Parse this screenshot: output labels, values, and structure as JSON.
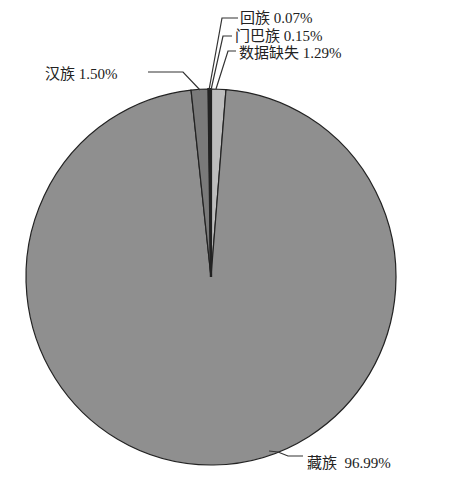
{
  "chart_data": {
    "type": "pie",
    "title": "",
    "categories": [
      "藏族",
      "汉族",
      "回族",
      "门巴族",
      "数据缺失"
    ],
    "values": [
      96.99,
      1.5,
      0.07,
      0.15,
      1.29
    ],
    "labels": [
      "藏族 96.99%",
      "汉族 1.50%",
      "回族 0.07%",
      "门巴族 0.15%",
      "数据缺失 1.29%"
    ],
    "colors": [
      "#8f8f8f",
      "#7a7a7a",
      "#111111",
      "#111111",
      "#bdbdbd"
    ],
    "legend": "none",
    "start_angle": "12 o'clock, clockwise"
  },
  "labels": {
    "zang": "藏族  96.99%",
    "han": "汉族 1.50%",
    "hui": "回族 0.07%",
    "menba": "门巴族 0.15%",
    "missing": "数据缺失 1.29%"
  }
}
